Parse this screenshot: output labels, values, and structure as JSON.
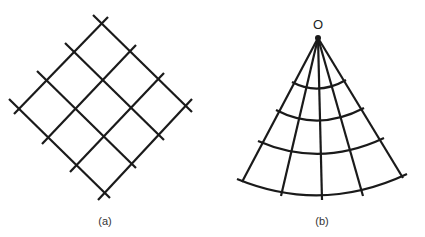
{
  "figure": {
    "panels": [
      {
        "id": "a",
        "label": "(a)",
        "description": "Square grid rotated 45 degrees (4x4 cells)"
      },
      {
        "id": "b",
        "label": "(b)",
        "description": "Fan-shaped polar grid radiating from point O",
        "apex_label": "O"
      }
    ],
    "stroke_color": "#1a1a1a"
  }
}
